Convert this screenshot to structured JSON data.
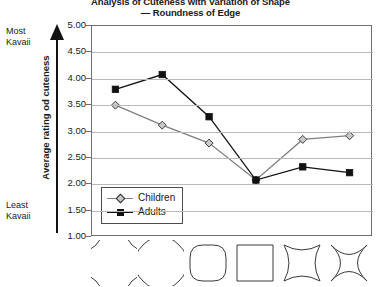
{
  "chart_data": {
    "type": "line",
    "title": "Analysis of Cuteness with Variation of Shape",
    "subtitle": "— Roundness of Edge",
    "ylabel": "Average rating od cuteness",
    "xlabel": "",
    "ylim": [
      1.0,
      5.0
    ],
    "yticks": [
      "1.00",
      "1.50",
      "2.00",
      "2.50",
      "3.00",
      "3.50",
      "4.00",
      "4.50",
      "5.00"
    ],
    "ytick_values": [
      1.0,
      1.5,
      2.0,
      2.5,
      3.0,
      3.5,
      4.0,
      4.5,
      5.0
    ],
    "grid": true,
    "legend_position": "lower-left-inside",
    "categories": [
      "shape-1",
      "shape-2",
      "shape-3",
      "shape-4",
      "shape-5",
      "shape-6"
    ],
    "category_icons": [
      "quatrefoil-clover-convex",
      "rounded-lobed-convex",
      "rounded-square",
      "square",
      "concave-square-mild",
      "concave-star-strong"
    ],
    "series": [
      {
        "name": "Children",
        "marker": "diamond",
        "marker_fill": "#c9c9c9",
        "line_color": "#808080",
        "values": [
          3.5,
          3.12,
          2.78,
          2.08,
          2.85,
          2.92
        ]
      },
      {
        "name": "Adults",
        "marker": "square",
        "marker_fill": "#111111",
        "line_color": "#111111",
        "values": [
          3.8,
          4.08,
          3.28,
          2.08,
          2.33,
          2.22
        ]
      }
    ]
  },
  "axis_annotation": {
    "top_label_line1": "Most",
    "top_label_line2": "Kavaii",
    "bottom_label_line1": "Least",
    "bottom_label_line2": "Kavaii"
  },
  "legend": {
    "items": [
      {
        "label": "Children"
      },
      {
        "label": "Adults"
      }
    ]
  },
  "colors": {
    "adults_line": "#111111",
    "children_line": "#808080",
    "children_marker_fill": "#c9c9c9",
    "gridline": "#b9b9b9",
    "frame": "#6f6f6f",
    "text": "#1a1a1a"
  }
}
